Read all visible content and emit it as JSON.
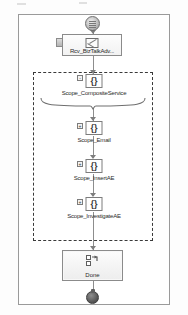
{
  "diagram": {
    "frame_border_color": "#9a9a9a",
    "connector_color": "#8d8d8d",
    "scope_border_color": "#3a3a3a"
  },
  "start": {
    "icon": "start-circle-icon"
  },
  "receive": {
    "label": "Rcv_BizTalkAdv...",
    "icon": "envelope-icon",
    "port_icon": "port-icon"
  },
  "scopes": [
    {
      "label": "Scope_CompositeService",
      "icon": "braces-icon",
      "expander": "-"
    },
    {
      "label": "Scope_Email",
      "icon": "braces-icon",
      "expander": "+"
    },
    {
      "label": "Scope_InsertAE",
      "icon": "braces-icon",
      "expander": "+"
    },
    {
      "label": "Scope_InvestigateAE",
      "icon": "braces-icon",
      "expander": "+"
    }
  ],
  "done": {
    "label": "Done",
    "icon": "send-shape-icon"
  },
  "end": {
    "icon": "end-terminator-icon"
  }
}
